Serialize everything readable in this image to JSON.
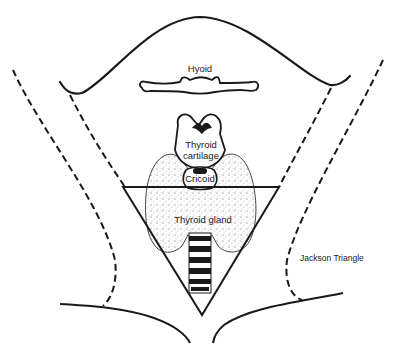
{
  "diagram": {
    "title": "",
    "labels": {
      "hyoid": "Hyoid",
      "thyroid_cartilage_line1": "Thyroid",
      "thyroid_cartilage_line2": "cartilage",
      "cricoid": "Cricoid",
      "thyroid_gland": "Thyroid gland",
      "jackson_triangle": "Jackson Triangle"
    },
    "structures": [
      "chin-jaw-outline",
      "hyoid-bone",
      "thyroid-cartilage",
      "cricoid-cartilage",
      "thyroid-gland",
      "trachea",
      "jackson-triangle",
      "sternocleidomastoid-dashed-borders",
      "clavicle-lines"
    ],
    "colors": {
      "ink": "#1a1a1a",
      "background": "#ffffff",
      "stipple": "#555555"
    }
  }
}
